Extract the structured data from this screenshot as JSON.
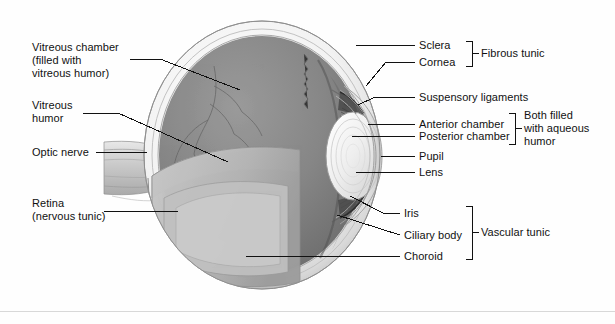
{
  "figure": {
    "background_color": "#fefefe",
    "line_color": "#111111",
    "text_color": "#111111"
  },
  "labels_left": [
    {
      "id": "vitreous-chamber",
      "text": "Vitreous chamber\n(filled with\nvitreous humor)"
    },
    {
      "id": "vitreous-humor",
      "text": "Vitreous\nhumor"
    },
    {
      "id": "optic-nerve",
      "text": "Optic nerve"
    },
    {
      "id": "retina",
      "text": "Retina\n(nervous tunic)"
    }
  ],
  "labels_right": [
    {
      "id": "sclera",
      "text": "Sclera"
    },
    {
      "id": "cornea",
      "text": "Cornea"
    },
    {
      "id": "suspensory-ligaments",
      "text": "Suspensory ligaments"
    },
    {
      "id": "anterior-chamber",
      "text": "Anterior chamber"
    },
    {
      "id": "posterior-chamber",
      "text": "Posterior chamber"
    },
    {
      "id": "pupil",
      "text": "Pupil"
    },
    {
      "id": "lens",
      "text": "Lens"
    },
    {
      "id": "iris",
      "text": "Iris"
    },
    {
      "id": "ciliary-body",
      "text": "Ciliary body"
    },
    {
      "id": "choroid",
      "text": "Choroid"
    }
  ],
  "groups": [
    {
      "id": "fibrous-tunic",
      "text": "Fibrous tunic",
      "members": [
        "Sclera",
        "Cornea"
      ]
    },
    {
      "id": "aqueous-humor",
      "text": "Both filled\nwith aqueous\nhumor",
      "members": [
        "Anterior chamber",
        "Posterior chamber"
      ]
    },
    {
      "id": "vascular-tunic",
      "text": "Vascular tunic",
      "members": [
        "Iris",
        "Ciliary body",
        "Choroid"
      ]
    }
  ]
}
